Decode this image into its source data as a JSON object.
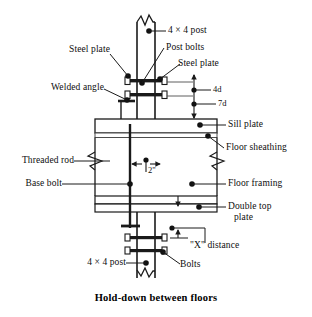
{
  "figure": {
    "caption": "Hold-down between floors",
    "title": "Hold-down between floors"
  },
  "colors": {
    "line": "#1a1a1a",
    "thin_line": "#4d4d4d",
    "fill": "#ffffff",
    "text": "#0d0d0d",
    "dot": "#111111"
  },
  "labels": {
    "post_top": "4 × 4 post",
    "post_bolts": "Post bolts",
    "steel_plate_left": "Steel plate",
    "steel_plate_right": "Steel plate",
    "welded_angle": "Welded angle",
    "sill_plate": "Sill plate",
    "floor_sheathing": "Floor sheathing",
    "threaded_rod": "Threaded rod",
    "base_bolt": "Base bolt",
    "floor_framing": "Floor framing",
    "double_top_plate_line1": "Double top",
    "double_top_plate_line2": "plate",
    "x_distance": "\"X\" distance",
    "bolts": "Bolts",
    "post_bottom": "4 × 4 post"
  },
  "dimensions": {
    "nail_spacing_top": "4d",
    "nail_spacing_bottom": "7d",
    "edge_distance": "2\"",
    "x_label": "\"X\" distance"
  },
  "components": [
    {
      "name": "upper-4x4-post",
      "label": "4 × 4 post"
    },
    {
      "name": "upper-steel-plate",
      "label": "Steel plate"
    },
    {
      "name": "post-bolts",
      "label": "Post bolts"
    },
    {
      "name": "welded-angle",
      "label": "Welded angle"
    },
    {
      "name": "sill-plate",
      "label": "Sill plate"
    },
    {
      "name": "floor-sheathing",
      "label": "Floor sheathing"
    },
    {
      "name": "threaded-rod",
      "label": "Threaded rod"
    },
    {
      "name": "base-bolt",
      "label": "Base bolt"
    },
    {
      "name": "floor-framing",
      "label": "Floor framing"
    },
    {
      "name": "double-top-plate",
      "label": "Double top plate"
    },
    {
      "name": "lower-4x4-post",
      "label": "4 × 4 post"
    },
    {
      "name": "lower-bolts",
      "label": "Bolts"
    }
  ]
}
